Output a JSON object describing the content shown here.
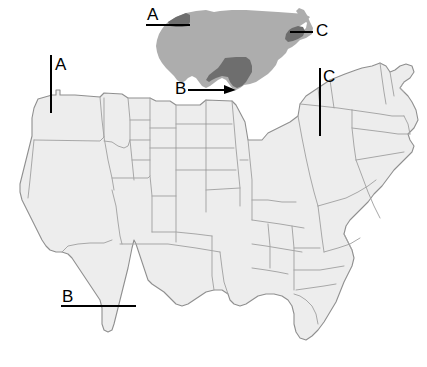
{
  "figure": {
    "background_color": "#ffffff"
  },
  "inset_map": {
    "name": "united-states-locator-inset",
    "base_fill": "#adadad",
    "highlight_fill": "#6e6e6e",
    "outline": "none",
    "x": 155,
    "y": 8,
    "width": 155,
    "height": 85,
    "highlighted_regions": [
      {
        "key": "A",
        "label": "A",
        "region": "pacific-northwest",
        "color": "#6e6e6e"
      },
      {
        "key": "B",
        "label": "B",
        "region": "south-central-texas",
        "color": "#6e6e6e"
      },
      {
        "key": "C",
        "label": "C",
        "region": "northeast-new-england",
        "color": "#6e6e6e"
      }
    ],
    "callouts": [
      {
        "key": "A",
        "label": "A",
        "label_x": 150,
        "label_y": 17,
        "line": "horizontal-right"
      },
      {
        "key": "B",
        "label": "B",
        "label_x": 178,
        "label_y": 93,
        "line": "horizontal-right"
      },
      {
        "key": "C",
        "label": "C",
        "label_x": 318,
        "label_y": 33,
        "line": "horizontal-left"
      }
    ]
  },
  "main_map": {
    "name": "united-states-detail-map",
    "fill": "#ededed",
    "stroke": "#9a9a9a",
    "outer_stroke": "#8a8a8a",
    "x": 18,
    "y": 78,
    "width": 400,
    "height": 275,
    "callouts": [
      {
        "key": "A",
        "label": "A",
        "label_x": 52,
        "label_y": 70,
        "orientation": "vertical-down",
        "points_to": "northwest-region"
      },
      {
        "key": "B",
        "label": "B",
        "label_x": 62,
        "label_y": 302,
        "orientation": "horizontal-right",
        "points_to": "south-central-region"
      },
      {
        "key": "C",
        "label": "C",
        "label_x": 320,
        "label_y": 82,
        "orientation": "vertical-down",
        "points_to": "northeast-region"
      }
    ]
  },
  "labels": {
    "a": "A",
    "b": "B",
    "c": "C"
  }
}
